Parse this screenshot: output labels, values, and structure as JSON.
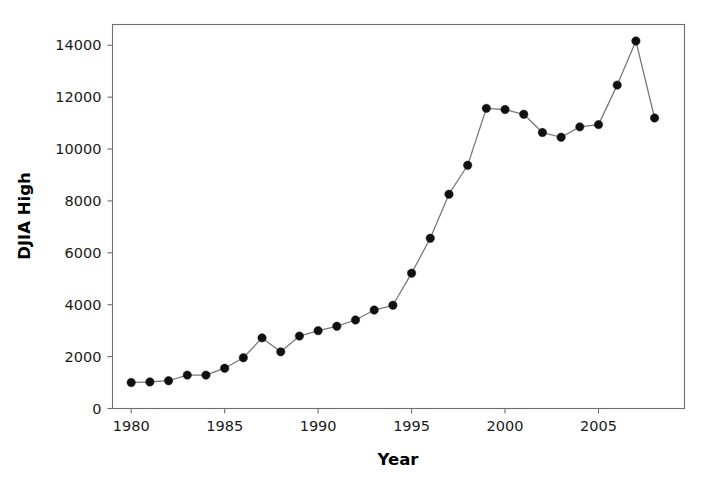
{
  "chart_data": {
    "type": "line",
    "title": "",
    "xlabel": "Year",
    "ylabel": "DJIA High",
    "xlim": [
      1979.0,
      2009.6
    ],
    "ylim": [
      0,
      14800
    ],
    "grid": false,
    "legend": false,
    "marker": "filled-circle",
    "x": [
      1980,
      1981,
      1982,
      1983,
      1984,
      1985,
      1986,
      1987,
      1988,
      1989,
      1990,
      1991,
      1992,
      1993,
      1994,
      1995,
      1996,
      1997,
      1998,
      1999,
      2000,
      2001,
      2002,
      2003,
      2004,
      2005,
      2006,
      2007,
      2008
    ],
    "values": [
      1000,
      1024,
      1070,
      1287,
      1287,
      1553,
      1956,
      2722,
      2184,
      2791,
      3000,
      3169,
      3413,
      3794,
      3978,
      5216,
      6561,
      8259,
      9374,
      11568,
      11523,
      11338,
      10635,
      10454,
      10855,
      10941,
      12464,
      14165,
      11196
    ],
    "series": [
      {
        "name": "DJIA High",
        "values": [
          1000,
          1024,
          1070,
          1287,
          1287,
          1553,
          1956,
          2722,
          2184,
          2791,
          3000,
          3169,
          3413,
          3794,
          3978,
          5216,
          6561,
          8259,
          9374,
          11568,
          11523,
          11338,
          10635,
          10454,
          10855,
          10941,
          12464,
          14165,
          11196
        ]
      }
    ],
    "y_ticks": [
      0,
      2000,
      4000,
      6000,
      8000,
      10000,
      12000,
      14000
    ],
    "y_tick_labels": [
      "0",
      "2000",
      "4000",
      "6000",
      "8000",
      "10000",
      "12000",
      "14000"
    ],
    "x_ticks": [
      1980,
      1985,
      1990,
      1995,
      2000,
      2005
    ],
    "x_tick_labels": [
      "1980",
      "1985",
      "1990",
      "1995",
      "2000",
      "2005"
    ],
    "colors": {
      "line": "#777777",
      "marker": "#101010",
      "axis": "#6e6e6e",
      "text": "#1a1a1a",
      "background": "#ffffff"
    }
  },
  "axis": {
    "x_title": "Year",
    "y_title": "DJIA High"
  }
}
